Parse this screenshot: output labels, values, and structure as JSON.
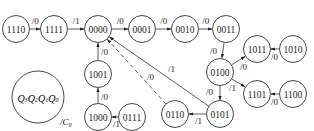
{
  "diagram": {
    "type": "state-transition",
    "legend": {
      "state_label": "Q3Q2Q1Q0",
      "output_label": "/C0"
    },
    "nodes": [
      {
        "id": "n1110",
        "label": "1110",
        "x": 16,
        "y": 29
      },
      {
        "id": "n1111",
        "label": "1111",
        "x": 54,
        "y": 29
      },
      {
        "id": "n0000",
        "label": "0000",
        "x": 98,
        "y": 29
      },
      {
        "id": "n0001",
        "label": "0001",
        "x": 142,
        "y": 29
      },
      {
        "id": "n0010",
        "label": "0010",
        "x": 185,
        "y": 29
      },
      {
        "id": "n0011",
        "label": "0011",
        "x": 226,
        "y": 29
      },
      {
        "id": "n0100",
        "label": "0100",
        "x": 220,
        "y": 72
      },
      {
        "id": "n1011",
        "label": "1011",
        "x": 257,
        "y": 49
      },
      {
        "id": "n1010",
        "label": "1010",
        "x": 293,
        "y": 49
      },
      {
        "id": "n1101",
        "label": "1101",
        "x": 257,
        "y": 94
      },
      {
        "id": "n1100",
        "label": "1100",
        "x": 293,
        "y": 94
      },
      {
        "id": "n0101",
        "label": "0101",
        "x": 220,
        "y": 114
      },
      {
        "id": "n0110",
        "label": "0110",
        "x": 175,
        "y": 114
      },
      {
        "id": "n0111",
        "label": "0111",
        "x": 132,
        "y": 117
      },
      {
        "id": "n1000",
        "label": "1000",
        "x": 98,
        "y": 117
      },
      {
        "id": "n1001",
        "label": "1001",
        "x": 98,
        "y": 74
      }
    ],
    "edges": [
      {
        "from": "1110",
        "to": "1111",
        "label": "/0"
      },
      {
        "from": "1111",
        "to": "0000",
        "label": "/1"
      },
      {
        "from": "0000",
        "to": "0001",
        "label": "/0"
      },
      {
        "from": "0001",
        "to": "0010",
        "label": "/0"
      },
      {
        "from": "0010",
        "to": "0011",
        "label": "/0"
      },
      {
        "from": "0011",
        "to": "0100",
        "label": "/0"
      },
      {
        "from": "0100",
        "to": "1011",
        "label": "/0"
      },
      {
        "from": "1010",
        "to": "1011",
        "label": "/0"
      },
      {
        "from": "0100",
        "to": "1101",
        "label": "/1"
      },
      {
        "from": "1100",
        "to": "1101",
        "label": "/0"
      },
      {
        "from": "0100",
        "to": "0101",
        "label": "/0"
      },
      {
        "from": "0101",
        "to": "0110",
        "label": "/1"
      },
      {
        "from": "0101",
        "to": "0000",
        "label": "/1"
      },
      {
        "from": "0110",
        "to": "0000",
        "label": "/0",
        "style": "dashed"
      },
      {
        "from": "0111",
        "to": "1000",
        "label": "/1"
      },
      {
        "from": "1000",
        "to": "1001",
        "label": "/0"
      },
      {
        "from": "1001",
        "to": "0000",
        "label": "/0"
      }
    ]
  }
}
